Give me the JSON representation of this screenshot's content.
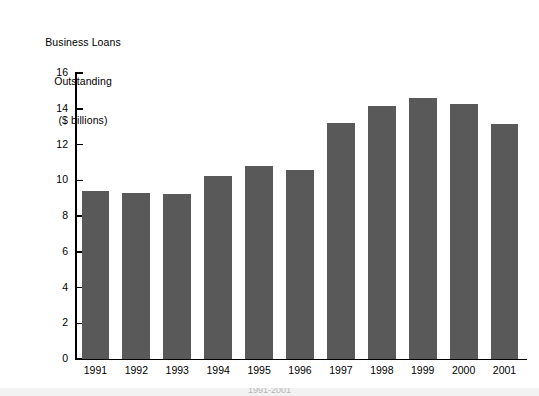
{
  "chart_data": {
    "type": "bar",
    "title": "",
    "xlabel": "",
    "ylabel": "Business Loans Outstanding ($ billions)",
    "ylabel_lines": [
      "Business Loans",
      "Outstanding",
      "($ billions)"
    ],
    "categories": [
      "1991",
      "1992",
      "1993",
      "1994",
      "1995",
      "1996",
      "1997",
      "1998",
      "1999",
      "2000",
      "2001"
    ],
    "values": [
      9.4,
      9.3,
      9.25,
      10.25,
      10.8,
      10.6,
      13.2,
      14.15,
      14.6,
      14.25,
      13.15
    ],
    "ylim": [
      0,
      16
    ],
    "yticks": [
      0,
      2,
      4,
      6,
      8,
      10,
      12,
      14,
      16
    ],
    "ytick_labels": [
      "0",
      "2",
      "4",
      "6",
      "8",
      "10",
      "12",
      "14",
      "16"
    ],
    "xtick_labels": [
      "1991",
      "1992",
      "1993",
      "1994",
      "1995",
      "1996",
      "1997",
      "1998",
      "1999",
      "2000",
      "2001"
    ],
    "grid": false,
    "legend": null,
    "legend_position": "none",
    "bar_color": "#595959",
    "axis_color": "#000000",
    "background_color": "#ffffff",
    "tick_direction": "in",
    "annotations": []
  },
  "footer": {
    "caption": "1991-2001"
  }
}
